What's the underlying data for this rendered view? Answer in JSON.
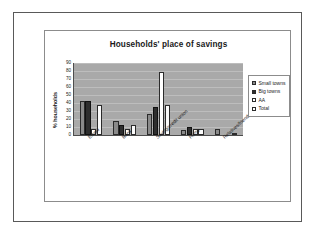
{
  "slide": {
    "name": "savings-chart-slide"
  },
  "chart_data": {
    "type": "bar",
    "title": "Households' place of savings",
    "xlabel": "",
    "ylabel": "% households",
    "ylim": [
      0,
      90
    ],
    "ytick_step": 10,
    "yticks": [
      90,
      80,
      70,
      60,
      50,
      40,
      30,
      20,
      10,
      0
    ],
    "grid": true,
    "legend_position": "right",
    "categories": [
      "Esusu",
      "Bank",
      "Saving/credit union",
      "Home",
      "Relatives/friends"
    ],
    "series": [
      {
        "name": "Small towns",
        "color": "#8a8a8a",
        "values": [
          43,
          17,
          26,
          6,
          8
        ]
      },
      {
        "name": "Big towns",
        "color": "#2e2e2e",
        "values": [
          43,
          12,
          35,
          10,
          0
        ]
      },
      {
        "name": "AA",
        "color": "#ffffff",
        "values": [
          7,
          7,
          79,
          7,
          0
        ]
      },
      {
        "name": "Total",
        "color": "#ffffff",
        "values": [
          37,
          13,
          38,
          7,
          2
        ]
      }
    ]
  }
}
